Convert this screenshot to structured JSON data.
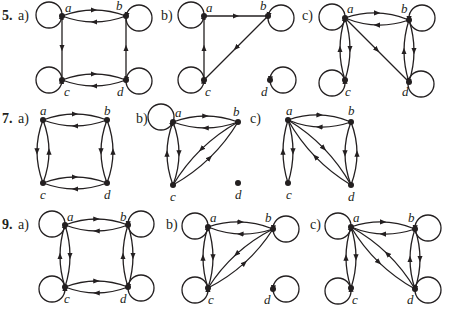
{
  "colors": {
    "ink": "#231f20",
    "background": "#ffffff"
  },
  "problems": [
    {
      "number": "5.",
      "parts": [
        {
          "label": "a)",
          "nodes": [
            {
              "id": "a",
              "x": 62,
              "y": 16,
              "lx": 65,
              "ly": 12
            },
            {
              "id": "b",
              "x": 126,
              "y": 16,
              "lx": 116,
              "ly": 10
            },
            {
              "id": "c",
              "x": 62,
              "y": 80,
              "lx": 64,
              "ly": 96
            },
            {
              "id": "d",
              "x": 126,
              "y": 80,
              "lx": 117,
              "ly": 96
            }
          ],
          "edges": [
            {
              "from": "b",
              "to": "a",
              "curve": -6
            },
            {
              "from": "a",
              "to": "b",
              "curve": -6
            },
            {
              "from": "a",
              "to": "c",
              "curve": 0
            },
            {
              "from": "d",
              "to": "b",
              "curve": 0
            },
            {
              "from": "d",
              "to": "c",
              "curve": -6
            },
            {
              "from": "c",
              "to": "d",
              "curve": -6
            }
          ],
          "loops": [
            {
              "node": "a",
              "cx": 49,
              "cy": 15
            },
            {
              "node": "b",
              "cx": 139,
              "cy": 18
            },
            {
              "node": "c",
              "cx": 49,
              "cy": 80
            },
            {
              "node": "d",
              "cx": 139,
              "cy": 81
            }
          ]
        },
        {
          "label": "b)",
          "nodes": [
            {
              "id": "a",
              "x": 204,
              "y": 16,
              "lx": 206,
              "ly": 12
            },
            {
              "id": "b",
              "x": 268,
              "y": 16,
              "lx": 260,
              "ly": 10
            },
            {
              "id": "c",
              "x": 204,
              "y": 80,
              "lx": 205,
              "ly": 96
            },
            {
              "id": "d",
              "x": 270,
              "y": 80,
              "lx": 261,
              "ly": 96
            }
          ],
          "edges": [
            {
              "from": "a",
              "to": "b",
              "curve": 0
            },
            {
              "from": "b",
              "to": "c",
              "curve": 0
            },
            {
              "from": "c",
              "to": "a",
              "curve": 0
            }
          ],
          "loops": [
            {
              "node": "a",
              "cx": 191,
              "cy": 15
            },
            {
              "node": "b",
              "cx": 281,
              "cy": 18
            },
            {
              "node": "c",
              "cx": 191,
              "cy": 80
            },
            {
              "node": "d",
              "cx": 283,
              "cy": 80
            }
          ]
        },
        {
          "label": "c)",
          "nodes": [
            {
              "id": "a",
              "x": 345,
              "y": 18,
              "lx": 347,
              "ly": 13
            },
            {
              "id": "b",
              "x": 409,
              "y": 20,
              "lx": 401,
              "ly": 13
            },
            {
              "id": "c",
              "x": 345,
              "y": 80,
              "lx": 345,
              "ly": 96
            },
            {
              "id": "d",
              "x": 409,
              "y": 82,
              "lx": 402,
              "ly": 96
            }
          ],
          "edges": [
            {
              "from": "b",
              "to": "a",
              "curve": -6
            },
            {
              "from": "a",
              "to": "b",
              "curve": -6
            },
            {
              "from": "a",
              "to": "c",
              "curve": -5
            },
            {
              "from": "c",
              "to": "a",
              "curve": -5
            },
            {
              "from": "a",
              "to": "d",
              "curve": 0
            },
            {
              "from": "b",
              "to": "d",
              "curve": -5
            },
            {
              "from": "d",
              "to": "b",
              "curve": -5
            }
          ],
          "loops": [
            {
              "node": "a",
              "cx": 332,
              "cy": 17
            },
            {
              "node": "b",
              "cx": 422,
              "cy": 18
            },
            {
              "node": "c",
              "cx": 332,
              "cy": 83
            },
            {
              "node": "d",
              "cx": 421,
              "cy": 84
            }
          ]
        }
      ]
    },
    {
      "number": "7.",
      "parts": [
        {
          "label": "a)",
          "nodes": [
            {
              "id": "a",
              "x": 43,
              "y": 120,
              "lx": 40,
              "ly": 115
            },
            {
              "id": "b",
              "x": 107,
              "y": 120,
              "lx": 104,
              "ly": 115
            },
            {
              "id": "c",
              "x": 43,
              "y": 183,
              "lx": 40,
              "ly": 199
            },
            {
              "id": "d",
              "x": 107,
              "y": 183,
              "lx": 104,
              "ly": 199
            }
          ],
          "edges": [
            {
              "from": "b",
              "to": "a",
              "curve": -6
            },
            {
              "from": "a",
              "to": "b",
              "curve": -6
            },
            {
              "from": "a",
              "to": "c",
              "curve": 6
            },
            {
              "from": "c",
              "to": "a",
              "curve": 6
            },
            {
              "from": "d",
              "to": "b",
              "curve": 6
            },
            {
              "from": "b",
              "to": "d",
              "curve": 6
            },
            {
              "from": "d",
              "to": "c",
              "curve": -6
            },
            {
              "from": "c",
              "to": "d",
              "curve": -6
            }
          ],
          "loops": []
        },
        {
          "label": "b)",
          "nodes": [
            {
              "id": "a",
              "x": 173,
              "y": 122,
              "lx": 175,
              "ly": 117
            },
            {
              "id": "b",
              "x": 238,
              "y": 122,
              "lx": 233,
              "ly": 116
            },
            {
              "id": "c",
              "x": 173,
              "y": 185,
              "lx": 170,
              "ly": 201
            },
            {
              "id": "d",
              "x": 238,
              "y": 183,
              "lx": 235,
              "ly": 199
            }
          ],
          "edges": [
            {
              "from": "a",
              "to": "b",
              "curve": -6
            },
            {
              "from": "b",
              "to": "a",
              "curve": -6
            },
            {
              "from": "c",
              "to": "a",
              "curve": -6
            },
            {
              "from": "a",
              "to": "c",
              "curve": -6
            },
            {
              "from": "c",
              "to": "b",
              "curve": 6
            },
            {
              "from": "b",
              "to": "c",
              "curve": 6
            }
          ],
          "loops": [
            {
              "node": "a",
              "cx": 161,
              "cy": 117
            }
          ]
        },
        {
          "label": "c)",
          "nodes": [
            {
              "id": "a",
              "x": 288,
              "y": 120,
              "lx": 286,
              "ly": 115
            },
            {
              "id": "b",
              "x": 351,
              "y": 122,
              "lx": 348,
              "ly": 115
            },
            {
              "id": "c",
              "x": 288,
              "y": 183,
              "lx": 286,
              "ly": 199
            },
            {
              "id": "d",
              "x": 351,
              "y": 185,
              "lx": 348,
              "ly": 201
            }
          ],
          "edges": [
            {
              "from": "a",
              "to": "b",
              "curve": -6
            },
            {
              "from": "b",
              "to": "a",
              "curve": -6
            },
            {
              "from": "c",
              "to": "a",
              "curve": -5
            },
            {
              "from": "a",
              "to": "c",
              "curve": -5
            },
            {
              "from": "d",
              "to": "a",
              "curve": -6
            },
            {
              "from": "a",
              "to": "d",
              "curve": -6
            },
            {
              "from": "d",
              "to": "b",
              "curve": 6
            },
            {
              "from": "b",
              "to": "d",
              "curve": 6
            }
          ],
          "loops": []
        }
      ]
    },
    {
      "number": "9.",
      "parts": [
        {
          "label": "a)",
          "nodes": [
            {
              "id": "a",
              "x": 65,
              "y": 225,
              "lx": 67,
              "ly": 221
            },
            {
              "id": "b",
              "x": 128,
              "y": 225,
              "lx": 120,
              "ly": 221
            },
            {
              "id": "c",
              "x": 65,
              "y": 287,
              "lx": 64,
              "ly": 303
            },
            {
              "id": "d",
              "x": 128,
              "y": 287,
              "lx": 120,
              "ly": 303
            }
          ],
          "edges": [
            {
              "from": "a",
              "to": "b",
              "curve": -6
            },
            {
              "from": "b",
              "to": "a",
              "curve": -6
            },
            {
              "from": "a",
              "to": "c",
              "curve": -5
            },
            {
              "from": "c",
              "to": "a",
              "curve": -5
            },
            {
              "from": "b",
              "to": "d",
              "curve": -5
            },
            {
              "from": "d",
              "to": "b",
              "curve": -5
            },
            {
              "from": "c",
              "to": "d",
              "curve": -6
            },
            {
              "from": "d",
              "to": "c",
              "curve": -6
            }
          ],
          "loops": [
            {
              "node": "a",
              "cx": 52,
              "cy": 224
            },
            {
              "node": "b",
              "cx": 141,
              "cy": 224
            },
            {
              "node": "c",
              "cx": 52,
              "cy": 289
            },
            {
              "node": "d",
              "cx": 141,
              "cy": 288
            }
          ]
        },
        {
          "label": "b)",
          "nodes": [
            {
              "id": "a",
              "x": 208,
              "y": 227,
              "lx": 210,
              "ly": 222
            },
            {
              "id": "b",
              "x": 273,
              "y": 229,
              "lx": 265,
              "ly": 222
            },
            {
              "id": "c",
              "x": 208,
              "y": 288,
              "lx": 208,
              "ly": 304
            },
            {
              "id": "d",
              "x": 273,
              "y": 289,
              "lx": 264,
              "ly": 304
            }
          ],
          "edges": [
            {
              "from": "a",
              "to": "b",
              "curve": -6
            },
            {
              "from": "b",
              "to": "a",
              "curve": -6
            },
            {
              "from": "c",
              "to": "a",
              "curve": -5
            },
            {
              "from": "a",
              "to": "c",
              "curve": -5
            },
            {
              "from": "c",
              "to": "b",
              "curve": 6
            },
            {
              "from": "b",
              "to": "c",
              "curve": 6
            }
          ],
          "loops": [
            {
              "node": "a",
              "cx": 195,
              "cy": 226
            },
            {
              "node": "b",
              "cx": 286,
              "cy": 229
            },
            {
              "node": "c",
              "cx": 195,
              "cy": 290
            },
            {
              "node": "d",
              "cx": 286,
              "cy": 289
            }
          ]
        },
        {
          "label": "c)",
          "nodes": [
            {
              "id": "a",
              "x": 351,
              "y": 227,
              "lx": 353,
              "ly": 222
            },
            {
              "id": "b",
              "x": 415,
              "y": 229,
              "lx": 408,
              "ly": 222
            },
            {
              "id": "c",
              "x": 351,
              "y": 288,
              "lx": 352,
              "ly": 304
            },
            {
              "id": "d",
              "x": 415,
              "y": 289,
              "lx": 407,
              "ly": 304
            }
          ],
          "edges": [
            {
              "from": "a",
              "to": "b",
              "curve": -6
            },
            {
              "from": "b",
              "to": "a",
              "curve": -6
            },
            {
              "from": "c",
              "to": "a",
              "curve": -5
            },
            {
              "from": "a",
              "to": "c",
              "curve": -5
            },
            {
              "from": "a",
              "to": "d",
              "curve": 6
            },
            {
              "from": "d",
              "to": "a",
              "curve": 6
            },
            {
              "from": "b",
              "to": "d",
              "curve": -5
            },
            {
              "from": "d",
              "to": "b",
              "curve": -5
            }
          ],
          "loops": [
            {
              "node": "a",
              "cx": 338,
              "cy": 226
            },
            {
              "node": "b",
              "cx": 428,
              "cy": 228
            },
            {
              "node": "c",
              "cx": 338,
              "cy": 291
            },
            {
              "node": "d",
              "cx": 428,
              "cy": 290
            }
          ]
        }
      ]
    }
  ],
  "labels": {
    "p5": "5.",
    "p7": "7.",
    "p9": "9.",
    "p5a": "a)",
    "p5b": "b)",
    "p5c": "c)",
    "p7a": "a)",
    "p7b": "b)",
    "p7c": "c)",
    "p9a": "a)",
    "p9b": "b)",
    "p9c": "c)"
  },
  "label_positions": {
    "p5": [
      2,
      20
    ],
    "p5a": [
      18,
      20
    ],
    "p5b": [
      161,
      20
    ],
    "p5c": [
      302,
      20
    ],
    "p7": [
      2,
      123
    ],
    "p7a": [
      18,
      123
    ],
    "p7b": [
      136,
      123
    ],
    "p7c": [
      250,
      123
    ],
    "p9": [
      2,
      229
    ],
    "p9a": [
      18,
      229
    ],
    "p9b": [
      166,
      229
    ],
    "p9c": [
      310,
      229
    ]
  }
}
